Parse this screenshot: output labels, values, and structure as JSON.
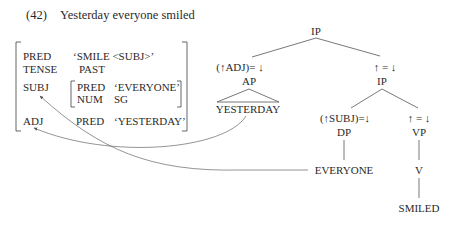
{
  "example": {
    "number": "(42)",
    "sentence": "Yesterday everyone smiled"
  },
  "fstructure": {
    "rows": [
      {
        "attr": "PRED",
        "value": "‘SMILE <SUBJ>’"
      },
      {
        "attr": "TENSE",
        "value": "PAST"
      },
      {
        "attr": "SUBJ",
        "inner": [
          {
            "attr": "PRED",
            "value": "‘EVERYONE’"
          },
          {
            "attr": "NUM",
            "value": "SG"
          }
        ]
      },
      {
        "attr": "ADJ",
        "inner": [
          {
            "attr": "PRED",
            "value": "‘YESTERDAY’"
          }
        ]
      }
    ]
  },
  "tree": {
    "root": "IP",
    "adj_annotation": "(↑ADJ)= ↓",
    "ap": "AP",
    "yesterday": "YESTERDAY",
    "ip_annotation": "↑ = ↓",
    "ip": "IP",
    "subj_annotation": "(↑SUBJ)=↓",
    "dp": "DP",
    "everyone": "EVERYONE",
    "vp_annotation": "↑ = ↓",
    "vp": "VP",
    "v": "V",
    "smiled": "SMILED"
  },
  "arrows": [
    {
      "from": "EVERYONE",
      "to": "SUBJ"
    },
    {
      "from": "YESTERDAY",
      "to": "ADJ"
    }
  ]
}
